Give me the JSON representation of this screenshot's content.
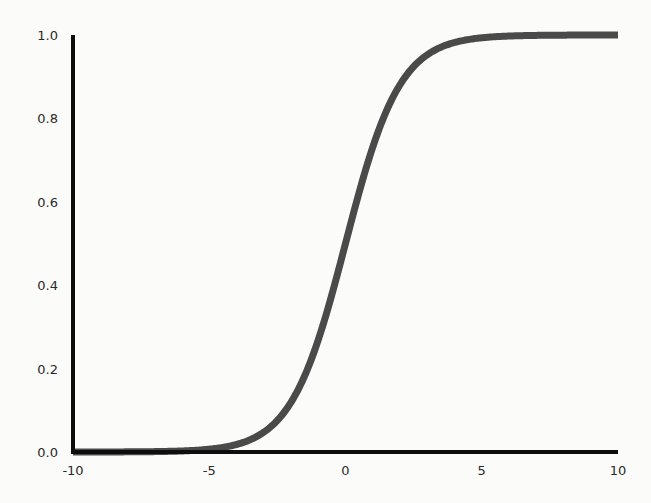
{
  "chart_data": {
    "type": "line",
    "title": "",
    "xlabel": "",
    "ylabel": "",
    "xlim": [
      -10,
      10
    ],
    "ylim": [
      0,
      1.0
    ],
    "grid": false,
    "legend": null,
    "x_ticks": [
      "-10",
      "-5",
      "0",
      "5",
      "10"
    ],
    "y_ticks": [
      "0.0",
      "0.2",
      "0.4",
      "0.6",
      "0.8",
      "1.0"
    ],
    "series": [
      {
        "name": "sigmoid",
        "function": "1 / (1 + exp(-x))",
        "color": "#4a4a4a",
        "x": [
          -10,
          -8,
          -6,
          -5,
          -4,
          -3,
          -2,
          -1,
          0,
          1,
          2,
          3,
          4,
          5,
          6,
          8,
          10
        ],
        "y": [
          5e-05,
          0.0003,
          0.0025,
          0.0067,
          0.018,
          0.047,
          0.119,
          0.269,
          0.5,
          0.731,
          0.881,
          0.953,
          0.982,
          0.9933,
          0.9975,
          0.9997,
          0.99995
        ]
      }
    ]
  },
  "colors": {
    "axis": "#0d0d0d",
    "curve": "#4a4a4a",
    "background": "#fbfbfa"
  }
}
